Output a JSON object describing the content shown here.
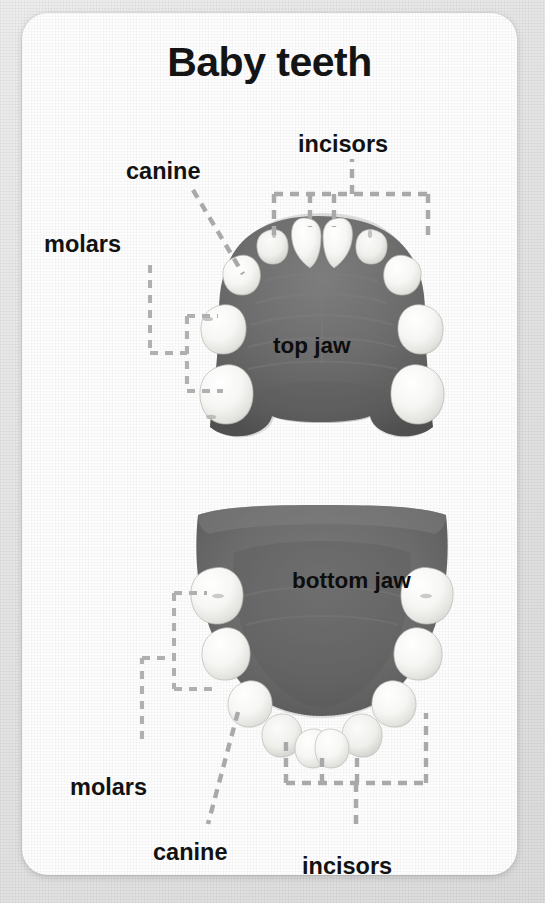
{
  "card": {
    "title": "Baby teeth",
    "background_color": "#fdfdfd",
    "page_background_color": "#e8e8e8"
  },
  "diagram": {
    "jaw_color": "#6a6a6a",
    "tooth_color": "#f5f5f3",
    "leader_color": "#a9a9a9",
    "jaws": [
      {
        "id": "top",
        "label": "top jaw"
      },
      {
        "id": "bottom",
        "label": "bottom jaw"
      }
    ]
  },
  "labels": {
    "incisors_top": "incisors",
    "canine_top": "canine",
    "molars_top": "molars",
    "molars_bottom": "molars",
    "canine_bottom": "canine",
    "incisors_bottom": "incisors",
    "top_jaw": "top jaw",
    "bottom_jaw": "bottom jaw"
  },
  "tooth_counts": {
    "top_incisors": 4,
    "top_canines": 2,
    "top_molars": 4,
    "bottom_incisors": 4,
    "bottom_canines": 2,
    "bottom_molars": 4,
    "total": 20
  }
}
